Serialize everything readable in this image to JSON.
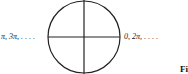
{
  "diagram": {
    "type": "unit-circle-angles",
    "left_label": "π, 3π, . . . .",
    "right_label": "0, 2π, . . . .",
    "figure_label": "Fi"
  }
}
